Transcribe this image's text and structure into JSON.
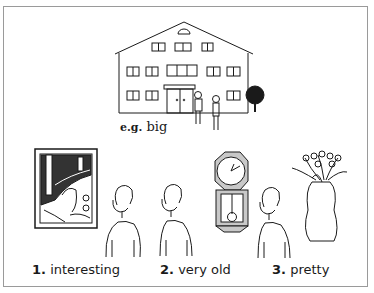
{
  "example": {
    "prefix": "e.g.",
    "word": "big",
    "picture": "large-house-with-two-people-and-tree"
  },
  "items": [
    {
      "number": "1.",
      "word": "interesting",
      "picture": "framed-artwork"
    },
    {
      "number": "2.",
      "word": "very old",
      "picture": "pendulum-wall-clock"
    },
    {
      "number": "3.",
      "word": "pretty",
      "picture": "flowers-in-vase"
    }
  ],
  "colors": {
    "ink": "#1a1a1a",
    "frame_border": "#9a9a9a",
    "clock_body": "#c8c8c8",
    "background": "#ffffff"
  }
}
